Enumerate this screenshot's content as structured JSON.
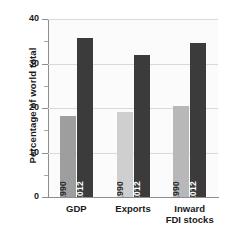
{
  "chart_data": {
    "type": "bar",
    "title": "",
    "subtitle": "",
    "xlabel": "",
    "ylabel": "Percentage of world total",
    "ylim": [
      0,
      40
    ],
    "ytick_values": [
      0,
      10,
      20,
      30,
      40
    ],
    "ytick_labels": [
      "0",
      "10",
      "20",
      "30",
      "40"
    ],
    "yminor_values": [
      5,
      15,
      25,
      35
    ],
    "grid": "horizontal",
    "legend": "none",
    "categories": [
      "GDP",
      "Exports",
      "Inward FDI stocks"
    ],
    "category_lines": [
      [
        "GDP"
      ],
      [
        "Exports"
      ],
      [
        "Inward",
        "FDI stocks"
      ]
    ],
    "series": [
      {
        "name": "1990",
        "values": [
          18.3,
          19.0,
          20.5
        ]
      },
      {
        "name": "2012",
        "values": [
          35.8,
          31.9,
          34.7
        ]
      }
    ],
    "bars": [
      {
        "category": "GDP",
        "series": "1990",
        "value": 18.3,
        "color": "#9e9e9e",
        "label_color": "light"
      },
      {
        "category": "GDP",
        "series": "2012",
        "value": 35.8,
        "color": "#3b3b3b",
        "label_color": "dark"
      },
      {
        "category": "Exports",
        "series": "1990",
        "value": 19.0,
        "color": "#cfcfcf",
        "label_color": "light"
      },
      {
        "category": "Exports",
        "series": "2012",
        "value": 31.9,
        "color": "#3b3b3b",
        "label_color": "dark"
      },
      {
        "category": "Inward FDI stocks",
        "series": "1990",
        "value": 20.5,
        "color": "#b8b8b8",
        "label_color": "light"
      },
      {
        "category": "Inward FDI stocks",
        "series": "2012",
        "value": 34.7,
        "color": "#3b3b3b",
        "label_color": "dark"
      }
    ],
    "colors": {
      "series_1990_gdp": "#9e9e9e",
      "series_1990_exports": "#cfcfcf",
      "series_1990_fdi": "#b8b8b8",
      "series_2012": "#3b3b3b",
      "axis": "#8d8d8d",
      "grid": "#d9d9d9",
      "plot_background": "#fbfbfb",
      "text": "#1a1a1a"
    }
  }
}
